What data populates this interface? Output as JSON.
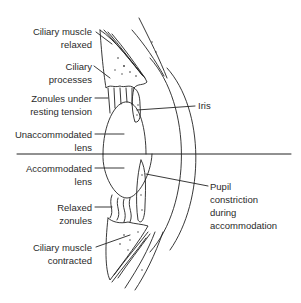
{
  "diagram": {
    "colors": {
      "line": "#222222",
      "text": "#2a2a2a",
      "background": "#ffffff"
    },
    "labels": {
      "ciliary_muscle_relaxed": [
        "Ciliary muscle",
        "relaxed"
      ],
      "ciliary_processes": [
        "Ciliary",
        "processes"
      ],
      "zonules_resting": [
        "Zonules under",
        "resting tension"
      ],
      "unaccommodated_lens": [
        "Unaccommodated",
        "lens"
      ],
      "iris": [
        "Iris"
      ],
      "accommodated_lens": [
        "Accommodated",
        "lens"
      ],
      "relaxed_zonules": [
        "Relaxed",
        "zonules"
      ],
      "ciliary_muscle_contracted": [
        "Ciliary muscle",
        "contracted"
      ],
      "pupil_constriction": [
        "Pupil",
        "constriction",
        "during",
        "accommodation"
      ]
    }
  }
}
